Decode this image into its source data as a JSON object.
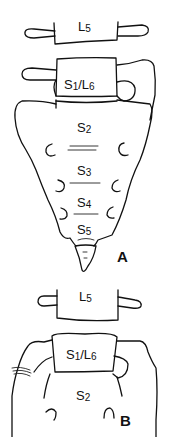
{
  "figure": {
    "type": "anatomical line drawing",
    "panels": [
      {
        "id": "A",
        "label": "A",
        "vertebrae": [
          {
            "name": "L",
            "sub": "5"
          },
          {
            "name": "S",
            "sub": "1",
            "alt_name": "L",
            "alt_sub": "6"
          },
          {
            "name": "S",
            "sub": "2"
          },
          {
            "name": "S",
            "sub": "3"
          },
          {
            "name": "S",
            "sub": "4"
          },
          {
            "name": "S",
            "sub": "5"
          }
        ]
      },
      {
        "id": "B",
        "label": "B",
        "vertebrae": [
          {
            "name": "L",
            "sub": "5"
          },
          {
            "name": "S",
            "sub": "1",
            "alt_name": "L",
            "alt_sub": "6"
          },
          {
            "name": "S",
            "sub": "2"
          }
        ]
      }
    ],
    "separator": "/"
  }
}
